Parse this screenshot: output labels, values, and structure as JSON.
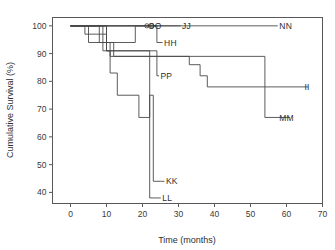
{
  "chart_data": {
    "type": "line",
    "title": "",
    "xlabel": "Time (months)",
    "ylabel": "Cumulative Survival (%)",
    "xlim": [
      -5,
      70
    ],
    "ylim": [
      36,
      103
    ],
    "xticks": [
      0,
      10,
      20,
      30,
      40,
      50,
      60,
      70
    ],
    "yticks": [
      40,
      50,
      60,
      70,
      80,
      90,
      100
    ],
    "grid": false,
    "legend_position": "inline-end-labels",
    "step_style": "post",
    "series": [
      {
        "name": "NN",
        "label": "NN",
        "label_x": 58,
        "label_y": 100,
        "x": [
          0,
          54
        ],
        "y": [
          100,
          100
        ]
      },
      {
        "name": "JJ",
        "label": "JJ",
        "label_x": 31,
        "label_y": 100,
        "x": [
          0,
          30
        ],
        "y": [
          100,
          100
        ]
      },
      {
        "name": "OO",
        "label": "OO",
        "label_x": 21.5,
        "label_y": 100,
        "x": [
          0,
          24
        ],
        "y": [
          100,
          100
        ]
      },
      {
        "name": "HH",
        "label": "HH",
        "label_x": 26,
        "label_y": 94,
        "x": [
          0,
          4,
          4,
          10,
          10,
          18,
          18,
          24,
          24
        ],
        "y": [
          100,
          100,
          97,
          97,
          94,
          94,
          100,
          100,
          94
        ]
      },
      {
        "name": "PP",
        "label": "PP",
        "label_x": 25,
        "label_y": 82,
        "x": [
          0,
          5,
          5,
          9,
          9,
          24,
          24
        ],
        "y": [
          100,
          100,
          94,
          94,
          91,
          91,
          82
        ]
      },
      {
        "name": "II",
        "label": "II",
        "label_x": 65,
        "label_y": 78,
        "x": [
          0,
          8,
          8,
          12,
          12,
          33,
          33,
          36,
          36,
          38,
          38,
          66
        ],
        "y": [
          100,
          100,
          94,
          94,
          89,
          89,
          86,
          86,
          82,
          82,
          78,
          78
        ]
      },
      {
        "name": "MM",
        "label": "MM",
        "label_x": 58,
        "label_y": 67,
        "x": [
          0,
          9,
          9,
          11,
          11,
          54,
          54,
          61
        ],
        "y": [
          100,
          100,
          94,
          94,
          89,
          89,
          67,
          67
        ]
      },
      {
        "name": "KK",
        "label": "KK",
        "label_x": 26.5,
        "label_y": 44,
        "x": [
          0,
          10,
          10,
          11,
          11,
          13,
          13,
          19,
          19,
          22,
          22,
          23,
          23,
          25
        ],
        "y": [
          100,
          100,
          91,
          91,
          83,
          83,
          75,
          75,
          67,
          67,
          75,
          75,
          44,
          44
        ]
      },
      {
        "name": "LL",
        "label": "LL",
        "label_x": 25.5,
        "label_y": 38,
        "x": [
          0,
          10,
          10,
          22,
          22,
          24
        ],
        "y": [
          100,
          100,
          91,
          91,
          38,
          38
        ]
      }
    ],
    "censor_marks": [
      {
        "x": 21.2,
        "y": 100,
        "shape": "circle"
      },
      {
        "x": 22.6,
        "y": 100,
        "shape": "circle"
      }
    ]
  }
}
